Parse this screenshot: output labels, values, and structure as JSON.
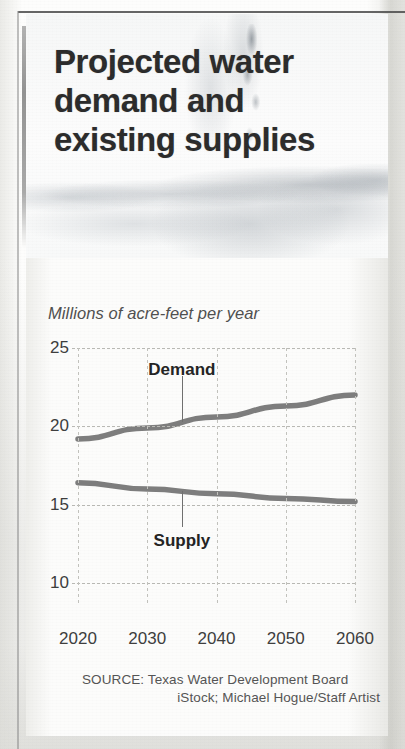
{
  "headline": "Projected water demand and existing supplies",
  "chart_data": {
    "type": "line",
    "title": "Projected water demand and existing supplies",
    "subtitle": "Millions of acre-feet per year",
    "xlabel": "",
    "ylabel": "Millions of acre-feet per year",
    "x": [
      2020,
      2030,
      2040,
      2050,
      2060
    ],
    "xtick_labels": [
      "2020",
      "2030",
      "2040",
      "2050",
      "2060"
    ],
    "ytick_labels": [
      "25",
      "20",
      "15",
      "10"
    ],
    "yticks": [
      25,
      20,
      15,
      10
    ],
    "xlim": [
      2020,
      2060
    ],
    "ylim": [
      8.6,
      25
    ],
    "grid": true,
    "legend": "inline-labels",
    "line_color": "#7d7d7d",
    "series": [
      {
        "name": "Demand",
        "label": "Demand",
        "values": [
          19.2,
          19.9,
          20.6,
          21.3,
          22.0
        ]
      },
      {
        "name": "Supply",
        "label": "Supply",
        "values": [
          16.4,
          16.0,
          15.7,
          15.4,
          15.2
        ]
      }
    ],
    "annotations": [
      {
        "text": "Demand",
        "x": 2035,
        "y": 23.6,
        "leader_to_y": 20.3
      },
      {
        "text": "Supply",
        "x": 2035,
        "y": 12.7,
        "leader_to_y": 15.85
      }
    ]
  },
  "source": {
    "line1": "SOURCE: Texas Water Development Board",
    "line2": "iStock; Michael Hogue/Staff Artist"
  }
}
